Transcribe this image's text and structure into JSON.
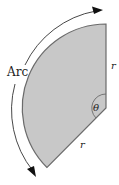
{
  "diagram": {
    "type": "circular-sector",
    "labels": {
      "arc": "Arc",
      "radius_right": "r",
      "radius_bottom": "r",
      "angle": "θ"
    },
    "colors": {
      "fill": "#c8c8c8",
      "stroke": "#6b6b6b",
      "arrow": "#222222"
    }
  }
}
